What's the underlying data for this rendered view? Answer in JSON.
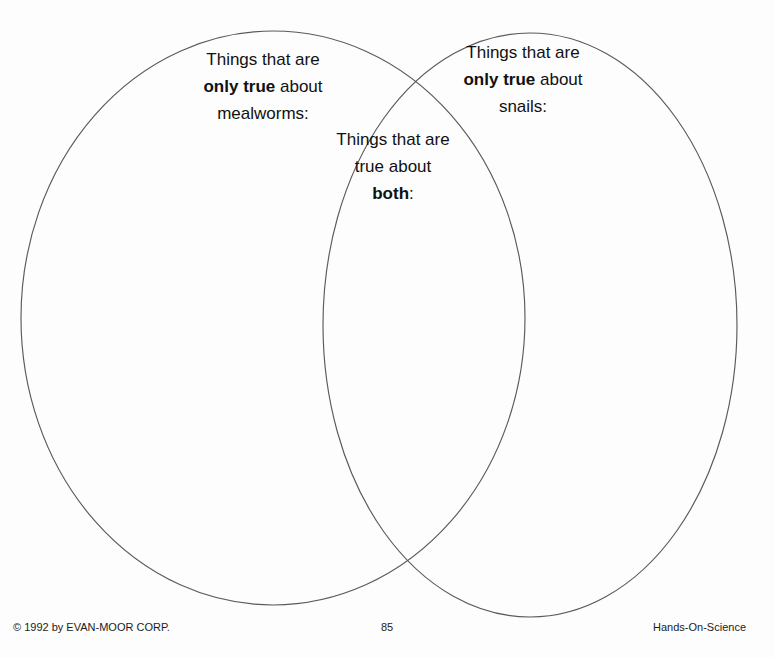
{
  "page": {
    "background_color": "#fdfdfd",
    "ink_color": "#111111",
    "line_color": "#5a5a5a"
  },
  "diagram": {
    "type": "venn",
    "left_circle": {
      "title_line_1": "Things that are",
      "title_line_2_bold": "only true",
      "title_line_2_rest": " about",
      "title_line_3": "mealworms:",
      "center_x": 273,
      "center_y": 318,
      "radius_x": 252,
      "radius_y": 287
    },
    "right_circle": {
      "title_line_1": "Things that are",
      "title_line_2_bold": "only true",
      "title_line_2_rest": " about",
      "title_line_3": "snails:",
      "center_x": 530,
      "center_y": 325,
      "radius_x": 207,
      "radius_y": 292
    },
    "overlap": {
      "title_line_1": "Things that are",
      "title_line_2": "true about",
      "title_line_3_bold": "both",
      "title_line_3_rest": ":"
    }
  },
  "footer": {
    "copyright": "© 1992 by EVAN-MOOR CORP.",
    "page_number": "85",
    "series": "Hands-On-Science"
  }
}
